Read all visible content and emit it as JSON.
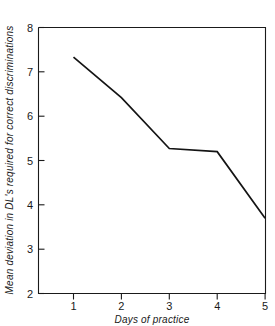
{
  "chart_data": {
    "type": "line",
    "title": "",
    "xlabel": "Days of practice",
    "ylabel": "Mean deviation in DL's required for correct discriminations",
    "x": [
      1,
      2,
      3,
      4,
      5
    ],
    "values": [
      7.33,
      6.42,
      5.27,
      5.2,
      3.7
    ],
    "series": [
      {
        "name": "",
        "values": [
          7.33,
          6.42,
          5.27,
          5.2,
          3.7
        ]
      }
    ],
    "xlim": [
      0.6,
      5.0
    ],
    "ylim": [
      2,
      8
    ],
    "xticks": [
      1,
      2,
      3,
      4,
      5
    ],
    "yticks": [
      2,
      3,
      4,
      5,
      6,
      7,
      8
    ],
    "xticklabels": [
      "1",
      "2",
      "3",
      "4",
      "5"
    ],
    "yticklabels": [
      "2",
      "3",
      "4",
      "5",
      "6",
      "7",
      "8"
    ],
    "grid": false,
    "legend": false,
    "legend_position": "none",
    "line_color": "#141414",
    "axis_color": "#1a1a1a",
    "background_color": "#ffffff"
  }
}
